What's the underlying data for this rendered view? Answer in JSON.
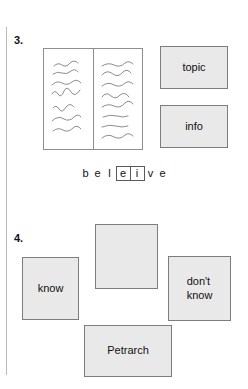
{
  "figure": {
    "panels": [
      {
        "number": "3.",
        "illustration": "open-book-with-squiggle-text",
        "boxes": [
          {
            "key": "topic",
            "label": "topic"
          },
          {
            "key": "info",
            "label": "info"
          }
        ],
        "word_exercise": {
          "letters_before": [
            "b",
            "e",
            "l"
          ],
          "boxed_letters": [
            "e",
            "i"
          ],
          "letters_after": [
            "v",
            "e"
          ],
          "full_word": "beleive"
        }
      },
      {
        "number": "4.",
        "boxes": [
          {
            "key": "know",
            "label": "know"
          },
          {
            "key": "empty",
            "label": ""
          },
          {
            "key": "dont-know",
            "label": "don't\nknow",
            "line1": "don't",
            "line2": "know"
          },
          {
            "key": "petrarch",
            "label": "Petrarch"
          }
        ]
      }
    ]
  },
  "colors": {
    "box_fill": "#e9e9e9",
    "box_border": "#7d7d7d",
    "book_border": "#8e8e8e",
    "rule": "#b9b9b9",
    "text": "#111111",
    "background": "#ffffff"
  }
}
